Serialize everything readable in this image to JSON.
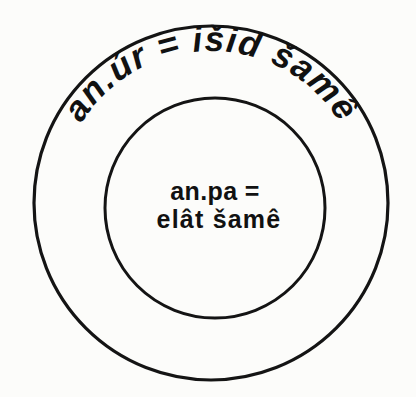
{
  "diagram": {
    "background_color": "#fcfcfa",
    "stroke_color": "#141414",
    "outer_ring": {
      "name": "outer-ring",
      "center_x": 211,
      "center_y": 203,
      "radius": 177,
      "label": "an.úr = išid šamê",
      "label_path_radius": 152
    },
    "inner_circle": {
      "name": "inner-circle",
      "center_x": 215,
      "center_y": 208,
      "radius": 110,
      "label_line_1": "an.pa =",
      "label_line_2": "elât šamê"
    }
  }
}
